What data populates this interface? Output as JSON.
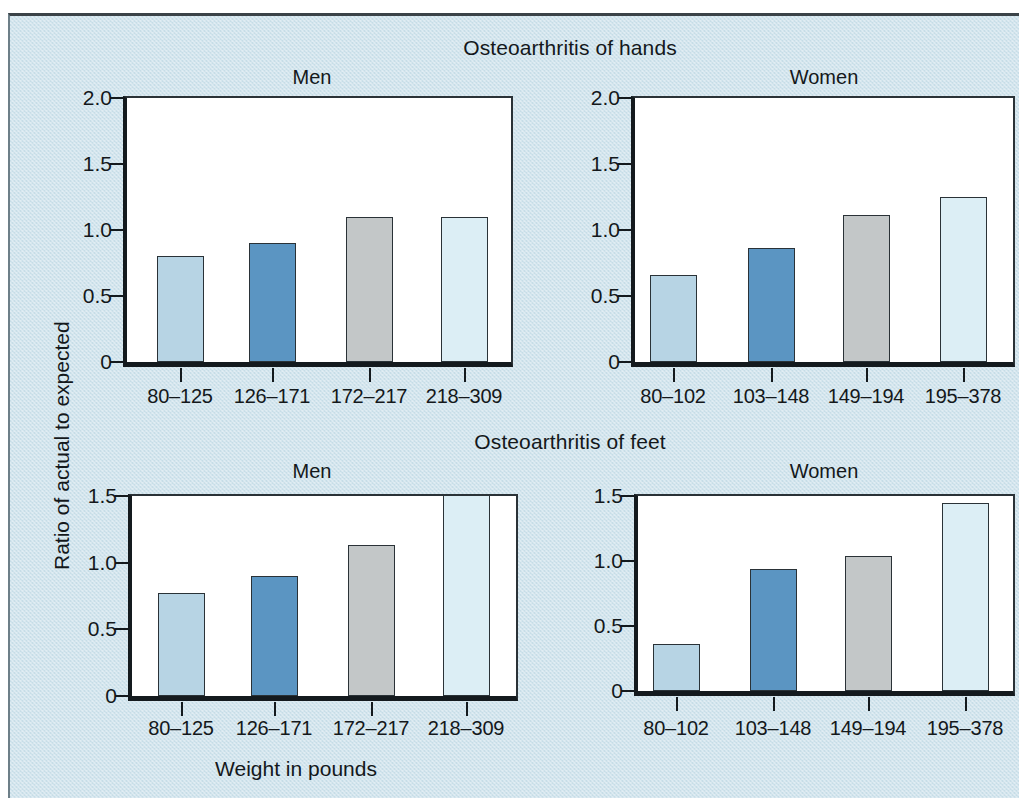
{
  "figure": {
    "background_color": "#cfe3ec",
    "axis_title_y": "Ratio of actual to expected",
    "axis_title_x": "Weight in pounds",
    "section_titles": [
      "Osteoarthritis of hands",
      "Osteoarthritis of feet"
    ],
    "panel_titles": [
      "Men",
      "Women"
    ]
  },
  "bar_colors": {
    "series_1": "#b7d4e4",
    "series_2": "#5b95c2",
    "series_3": "#c3c7c8",
    "series_4": "#dceef5",
    "outline": "#2a3237"
  },
  "chart_data": [
    {
      "type": "bar",
      "title": "Osteoarthritis of hands",
      "subtitle": "Men",
      "panel": "top-left",
      "xlabel": "Weight in pounds",
      "ylabel": "Ratio of actual to expected",
      "categories": [
        "80–125",
        "126–171",
        "172–217",
        "218–309"
      ],
      "values": [
        0.8,
        0.9,
        1.1,
        1.1
      ],
      "yticks": [
        "0",
        "0.5",
        "1.0",
        "1.5",
        "2.0"
      ],
      "ytickvalues": [
        0,
        0.5,
        1.0,
        1.5,
        2.0
      ],
      "ylim": [
        0,
        2.0
      ],
      "grid": false,
      "legend": "none",
      "bar_colors": [
        "#b7d4e4",
        "#5b95c2",
        "#c3c7c8",
        "#dceef5"
      ]
    },
    {
      "type": "bar",
      "title": "Osteoarthritis of hands",
      "subtitle": "Women",
      "panel": "top-right",
      "xlabel": "Weight in pounds",
      "ylabel": "Ratio of actual to expected",
      "categories": [
        "80–102",
        "103–148",
        "149–194",
        "195–378"
      ],
      "values": [
        0.66,
        0.86,
        1.11,
        1.25
      ],
      "yticks": [
        "0",
        "0.5",
        "1.0",
        "1.5",
        "2.0"
      ],
      "ytickvalues": [
        0,
        0.5,
        1.0,
        1.5,
        2.0
      ],
      "ylim": [
        0,
        2.0
      ],
      "grid": false,
      "legend": "none",
      "bar_colors": [
        "#b7d4e4",
        "#5b95c2",
        "#c3c7c8",
        "#dceef5"
      ]
    },
    {
      "type": "bar",
      "title": "Osteoarthritis of feet",
      "subtitle": "Men",
      "panel": "bottom-left",
      "xlabel": "Weight in pounds",
      "ylabel": "Ratio of actual to expected",
      "categories": [
        "80–125",
        "126–171",
        "172–217",
        "218–309"
      ],
      "values": [
        0.77,
        0.9,
        1.13,
        1.5
      ],
      "value_notes": [
        "",
        "",
        "",
        "bar clipped at top of axis"
      ],
      "yticks": [
        "0",
        "0.5",
        "1.0",
        "1.5"
      ],
      "ytickvalues": [
        0,
        0.5,
        1.0,
        1.5
      ],
      "ylim": [
        0,
        1.5
      ],
      "grid": false,
      "legend": "none",
      "bar_colors": [
        "#b7d4e4",
        "#5b95c2",
        "#c3c7c8",
        "#dceef5"
      ]
    },
    {
      "type": "bar",
      "title": "Osteoarthritis of feet",
      "subtitle": "Women",
      "panel": "bottom-right",
      "xlabel": "Weight in pounds",
      "ylabel": "Ratio of actual to expected",
      "categories": [
        "80–102",
        "103–148",
        "149–194",
        "195–378"
      ],
      "values": [
        0.36,
        0.94,
        1.04,
        1.45
      ],
      "yticks": [
        "0",
        "0.5",
        "1.0",
        "1.5"
      ],
      "ytickvalues": [
        0,
        0.5,
        1.0,
        1.5
      ],
      "ylim": [
        0,
        1.5
      ],
      "grid": false,
      "legend": "none",
      "bar_colors": [
        "#b7d4e4",
        "#5b95c2",
        "#c3c7c8",
        "#dceef5"
      ]
    }
  ]
}
